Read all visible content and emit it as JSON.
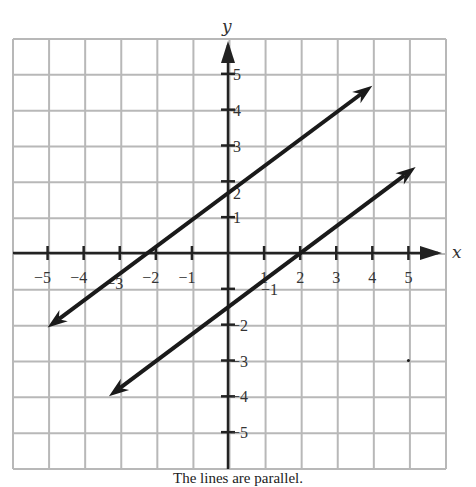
{
  "chart_data": {
    "type": "line",
    "title": "",
    "caption": "The lines are parallel.",
    "xlabel": "x",
    "ylabel": "y",
    "xlim": [
      -6,
      6
    ],
    "ylim": [
      -6,
      6
    ],
    "grid": true,
    "x_ticks": [
      -5,
      -4,
      -3,
      -2,
      -1,
      1,
      2,
      3,
      4,
      5
    ],
    "y_ticks": [
      -5,
      -4,
      -3,
      -2,
      -1,
      1,
      2,
      3,
      4,
      5
    ],
    "series": [
      {
        "name": "upper line",
        "slope": 0.75,
        "intercept": 1.67,
        "x": [
          -5,
          4
        ],
        "y": [
          -2.08,
          4.67
        ],
        "arrows": "both"
      },
      {
        "name": "lower line",
        "slope": 0.75,
        "intercept": -1.5,
        "x": [
          -3.3,
          5.2
        ],
        "y": [
          -4.0,
          2.4
        ],
        "arrows": "both"
      }
    ],
    "annotations": [
      {
        "x": 5,
        "y": -3,
        "text": "•"
      }
    ]
  },
  "colors": {
    "grid": "#b8b8b8",
    "axis": "#222222",
    "line": "#1a1a1a",
    "text": "#333333"
  }
}
